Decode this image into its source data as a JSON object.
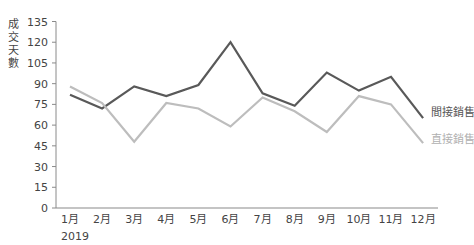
{
  "chart_data": {
    "type": "line",
    "title": "",
    "xlabel": "2019",
    "ylabel": "成交天數",
    "categories": [
      "1月",
      "2月",
      "3月",
      "4月",
      "5月",
      "6月",
      "7月",
      "8月",
      "9月",
      "10月",
      "11月",
      "12月"
    ],
    "series": [
      {
        "name": "間接銷售",
        "color": "#595959",
        "values": [
          82,
          72,
          88,
          81,
          89,
          120,
          83,
          74,
          98,
          85,
          95,
          65
        ]
      },
      {
        "name": "直接銷售",
        "color": "#bdbdbd",
        "values": [
          88,
          76,
          48,
          76,
          72,
          59,
          80,
          70,
          55,
          81,
          75,
          47
        ]
      }
    ],
    "yticks": [
      0,
      15,
      30,
      45,
      60,
      75,
      90,
      105,
      120,
      135
    ],
    "ylim": [
      0,
      135
    ],
    "grid": false,
    "legend_position": "right, at line ends"
  },
  "axis": {
    "ylabel_chars": [
      "成",
      "交",
      "天",
      "數"
    ],
    "year_label": "2019"
  }
}
